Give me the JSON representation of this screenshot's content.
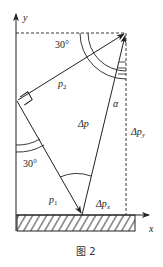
{
  "figure": {
    "caption": "图 2",
    "colors": {
      "stroke": "#222222",
      "background": "#ffffff"
    }
  },
  "axes": {
    "x_label": "x",
    "y_label": "y"
  },
  "vectors": {
    "p1": {
      "label": "p",
      "subscript": "1"
    },
    "p2": {
      "label": "p",
      "subscript": "2"
    },
    "delta_p": {
      "label": "Δp"
    },
    "delta_px": {
      "label": "Δp",
      "subscript": "x"
    },
    "delta_py": {
      "label": "Δp",
      "subscript": "y"
    }
  },
  "angles": {
    "top": "30°",
    "left": "30°",
    "alpha": "α"
  }
}
